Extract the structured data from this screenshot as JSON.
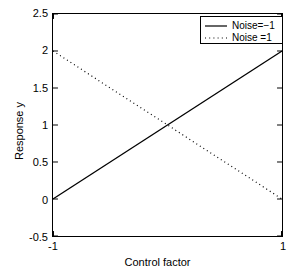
{
  "chart_data": {
    "type": "line",
    "title": "",
    "xlabel": "Control factor",
    "ylabel": "Response y",
    "xlim": [
      -1,
      1
    ],
    "ylim": [
      -0.5,
      2.5
    ],
    "xticks": [
      "-1",
      "1"
    ],
    "xtick_values": [
      -1,
      1
    ],
    "yticks": [
      "-0.5",
      "0",
      "0.5",
      "1",
      "1.5",
      "2",
      "2.5"
    ],
    "ytick_values": [
      -0.5,
      0,
      0.5,
      1,
      1.5,
      2,
      2.5
    ],
    "grid": false,
    "legend_position": "top-right",
    "x": [
      -1,
      1
    ],
    "series": [
      {
        "name": "Noise=−1",
        "style": "solid",
        "color": "#000000",
        "values": [
          0,
          2
        ]
      },
      {
        "name": "Noise =1",
        "style": "dotted",
        "color": "#000000",
        "values": [
          2,
          0
        ]
      }
    ]
  },
  "axes": {
    "ylabel": "Response y",
    "xlabel": "Control factor",
    "ytick_labels": [
      {
        "text": "2.5",
        "value": 2.5
      },
      {
        "text": "2",
        "value": 2
      },
      {
        "text": "1.5",
        "value": 1.5
      },
      {
        "text": "1",
        "value": 1
      },
      {
        "text": "0.5",
        "value": 0.5
      },
      {
        "text": "0",
        "value": 0
      },
      {
        "text": "-0.5",
        "value": -0.5
      }
    ],
    "xtick_labels": [
      {
        "text": "-1",
        "value": -1
      },
      {
        "text": "1",
        "value": 1
      }
    ]
  },
  "legend": {
    "entries": [
      {
        "label": "Noise=−1",
        "style": "solid"
      },
      {
        "label": "Noise =1",
        "style": "dotted"
      }
    ]
  },
  "colors": {
    "line": "#000000",
    "axis": "#000000",
    "background": "#ffffff"
  }
}
